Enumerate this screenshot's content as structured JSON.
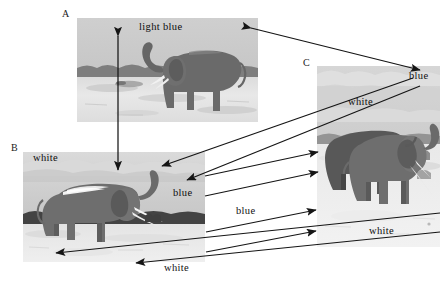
{
  "figure": {
    "background": "#ffffff",
    "panels": [
      {
        "id": "A",
        "letter": "A",
        "caption_words": [
          "light blue"
        ],
        "sky_color": "#c9c9c9",
        "ground_color": "#e3e3e3",
        "animal_color": "#6e6e6e"
      },
      {
        "id": "B",
        "letter": "B",
        "caption_words": [
          "white",
          "blue",
          "white"
        ],
        "sky_color": "#cfcfcf",
        "ground_color": "#ededed",
        "animal_color": "#707070"
      },
      {
        "id": "C",
        "letter": "C",
        "caption_words": [
          "blue",
          "white",
          "white"
        ],
        "sky_color": "#d2d2d2",
        "ground_color": "#efefef",
        "animal_color": "#5f5f5f"
      }
    ]
  },
  "labels": {
    "letter_a": "A",
    "letter_b": "B",
    "letter_c": "C",
    "a_light_blue": "light blue",
    "b_white_top": "white",
    "b_blue": "blue",
    "b_white_bottom": "white",
    "c_blue": "blue",
    "c_white_mid": "white",
    "c_white_bottom": "white",
    "mid_blue": "blue",
    "right_blue": "blue"
  },
  "colors": {
    "arrow": "#151515",
    "text": "#111111",
    "page_bg": "#ffffff"
  },
  "arrows": [
    {
      "name": "a-to-b-vertical",
      "type": "double-headed",
      "from": [
        118,
        35
      ],
      "to": [
        118,
        170
      ]
    },
    {
      "name": "a-to-c-diagonal",
      "type": "double-headed",
      "from": [
        250,
        27
      ],
      "to": [
        421,
        70
      ]
    },
    {
      "name": "b-sky-to-right-blue",
      "type": "single-headed",
      "from": [
        258,
        140
      ],
      "to": [
        160,
        166
      ]
    },
    {
      "name": "b-sky-to-blue-label",
      "type": "single-headed",
      "from": [
        258,
        166
      ],
      "to": [
        183,
        183
      ]
    },
    {
      "name": "b-ground-to-c-white",
      "type": "single-headed",
      "from": [
        215,
        127
      ],
      "to": [
        318,
        166
      ]
    },
    {
      "name": "b-ground-to-c-elephant",
      "type": "single-headed",
      "from": [
        216,
        180
      ],
      "to": [
        318,
        195
      ]
    },
    {
      "name": "b-left-ground-out",
      "type": "single-headed",
      "from": [
        290,
        225
      ],
      "to": [
        58,
        256
      ]
    },
    {
      "name": "b-right-ground-out",
      "type": "single-headed",
      "from": [
        290,
        250
      ],
      "to": [
        140,
        265
      ]
    },
    {
      "name": "mid-to-c-1",
      "type": "single-headed",
      "from": [
        205,
        232
      ],
      "to": [
        316,
        212
      ]
    },
    {
      "name": "mid-to-c-2",
      "type": "single-headed",
      "from": [
        205,
        253
      ],
      "to": [
        316,
        232
      ]
    }
  ]
}
